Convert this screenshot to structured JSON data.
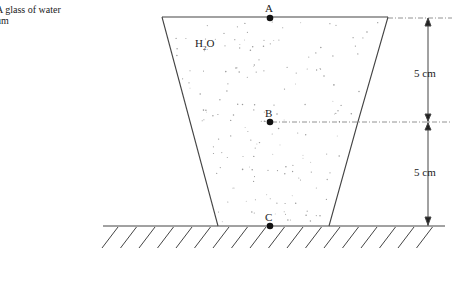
{
  "caption": {
    "line1": "A glass of water",
    "line2": "um"
  },
  "diagram": {
    "substance_label": "H",
    "substance_sub": "2",
    "substance_suffix": "O",
    "points": [
      {
        "label": "A",
        "x": 270,
        "y": 18,
        "position": "top surface"
      },
      {
        "label": "B",
        "x": 270,
        "y": 122,
        "position": "mid depth"
      },
      {
        "label": "C",
        "x": 270,
        "y": 226,
        "position": "bottom"
      }
    ],
    "dimensions": [
      {
        "label": "5 cm",
        "from": "A",
        "to": "B"
      },
      {
        "label": "5 cm",
        "from": "B",
        "to": "C"
      }
    ],
    "colors": {
      "line": "#444444",
      "stipple": "#9a9a9a",
      "background": "#ffffff"
    }
  }
}
